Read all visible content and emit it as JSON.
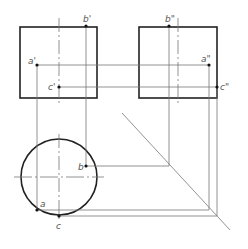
{
  "diagram": {
    "type": "orthographic-projection",
    "views": {
      "front": {
        "x": 20,
        "y": 27,
        "w": 77,
        "h": 71,
        "centerline_x": 59
      },
      "side": {
        "x": 139,
        "y": 27,
        "w": 78,
        "h": 71,
        "centerline_x": 178
      },
      "top": {
        "cx": 59,
        "cy": 177,
        "r": 38
      }
    },
    "labels": {
      "b_prime": "b'",
      "a_prime": "a'",
      "c_prime": "c'",
      "b_dprime": "b\"",
      "a_dprime": "a\"",
      "c_dprime": "c\"",
      "b": "b",
      "a": "a",
      "c": "c"
    },
    "points": {
      "b_prime": [
        86,
        26
      ],
      "a_prime": [
        37,
        65
      ],
      "c_prime": [
        59,
        87
      ],
      "b_dprime": [
        169,
        26
      ],
      "a_dprime": [
        209,
        65
      ],
      "c_dprime": [
        217,
        87
      ],
      "b": [
        86,
        166
      ],
      "a": [
        37,
        210
      ],
      "c": [
        59,
        216
      ]
    },
    "miter_line": {
      "x1": 122,
      "y1": 113,
      "x2": 230,
      "y2": 230
    },
    "colors": {
      "outline": "#222222",
      "thin": "#777777",
      "label": "#555555"
    }
  }
}
